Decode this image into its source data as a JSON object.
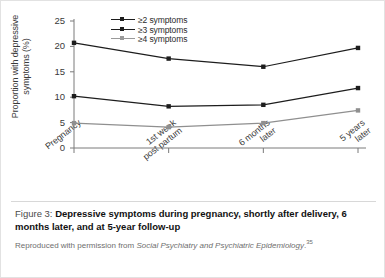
{
  "figure": {
    "label": "Figure 3:",
    "title": "Depressive symptoms during pregnancy, shortly after delivery, 6 months later, and at 5-year follow-up",
    "credit_prefix": "Reproduced with permission from ",
    "credit_journal": "Social Psychiatry and Psychiatric Epidemiology",
    "credit_suffix": ".",
    "credit_refmark": "35"
  },
  "colors": {
    "line": "#1d1d1d",
    "line_faint": "#8f8f8f",
    "axis": "#7a7a7a",
    "text": "#2b2b2b",
    "border": "#e2e2e2"
  },
  "chart_data": {
    "type": "line",
    "title": "",
    "xlabel": "",
    "ylabel": "Proportion with depressive symptoms (%)",
    "categories": [
      "Pregnancy",
      "1st week\npost partum",
      "6 months\nlater",
      "5 years\nlater"
    ],
    "series": [
      {
        "name": "≥2 symptoms",
        "values": [
          20.7,
          17.6,
          16.0,
          19.7
        ]
      },
      {
        "name": "≥3 symptoms",
        "values": [
          10.2,
          8.2,
          8.5,
          11.8
        ]
      },
      {
        "name": "≥4 symptoms",
        "values": [
          4.9,
          4.1,
          4.9,
          7.4
        ]
      }
    ],
    "ylim": [
      0,
      25
    ],
    "yticks": [
      0,
      5,
      10,
      15,
      20,
      25
    ],
    "ytick_labels": [
      "0",
      "5",
      "10",
      "15",
      "20",
      "25"
    ],
    "grid": false,
    "legend_position": "top-center"
  }
}
